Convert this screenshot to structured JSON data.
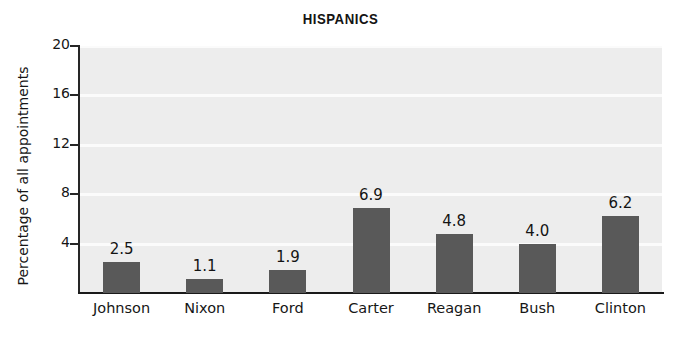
{
  "chart_data": {
    "type": "bar",
    "title": "HISPANICS",
    "xlabel": "",
    "ylabel": "Percentage of all appointments",
    "categories": [
      "Johnson",
      "Nixon",
      "Ford",
      "Carter",
      "Reagan",
      "Bush",
      "Clinton"
    ],
    "values": [
      2.5,
      1.1,
      1.9,
      6.9,
      4.8,
      4.0,
      6.2
    ],
    "value_labels": [
      "2.5",
      "1.1",
      "1.9",
      "6.9",
      "4.8",
      "4.0",
      "6.2"
    ],
    "ylim": [
      0,
      20
    ],
    "yticks": [
      20,
      16,
      12,
      8,
      4
    ],
    "ytick_labels": [
      "20",
      "16",
      "12",
      "8",
      "4"
    ],
    "grid": true,
    "legend": "none",
    "bar_color": "#595959",
    "plot_background": "#ededed",
    "gridline_color": "#fbfbfb",
    "axis_color": "#1a1a1a",
    "page_background": "#ffffff"
  }
}
